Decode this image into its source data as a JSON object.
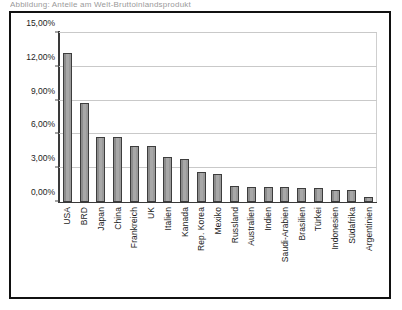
{
  "title_strip": "Abbildung: Anteile am Welt-Bruttoinlandsprodukt",
  "frame": {
    "border_color": "#111111"
  },
  "chart_data": {
    "type": "bar",
    "title": "",
    "xlabel": "",
    "ylabel": "",
    "ylim": [
      0,
      15
    ],
    "ytick_labels": [
      "0,00%",
      "3,00%",
      "6,00%",
      "9,00%",
      "12,00%",
      "15,00%"
    ],
    "ytick_values": [
      0,
      3,
      6,
      9,
      12,
      15
    ],
    "grid": true,
    "legend": "none",
    "bar_color": "#a8a8a8",
    "bar_edge_color": "#3d3d3d",
    "categories": [
      "USA",
      "BRD",
      "Japan",
      "China",
      "Frankreich",
      "UK",
      "Italien",
      "Kanada",
      "Rep. Korea",
      "Mexiko",
      "Russland",
      "Australien",
      "Indien",
      "Saudi-Arabien",
      "Brasilien",
      "Türkei",
      "Indonesien",
      "Südafrika",
      "Argentinien"
    ],
    "values": [
      13.2,
      8.8,
      5.75,
      5.8,
      4.95,
      5.0,
      4.0,
      3.85,
      2.7,
      2.5,
      1.4,
      1.3,
      1.3,
      1.3,
      1.25,
      1.2,
      1.1,
      1.05,
      0.45
    ],
    "value_labels": [
      "13,20%",
      "8,80%",
      "5,75%",
      "5,80%",
      "4,95%",
      "5,00%",
      "4,00%",
      "3,85%",
      "2,70%",
      "2,50%",
      "1,40%",
      "1,30%",
      "1,30%",
      "1,30%",
      "1,25%",
      "1,20%",
      "1,10%",
      "1,05%",
      "0,45%"
    ]
  }
}
